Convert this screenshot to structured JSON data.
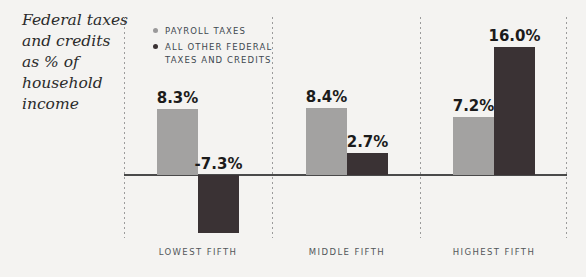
{
  "title": {
    "lines": [
      "Federal taxes",
      "and credits",
      "as % of",
      "household",
      "income"
    ]
  },
  "legend": {
    "items": [
      {
        "label": "PAYROLL TAXES",
        "color": "#9a999a"
      },
      {
        "label": "ALL OTHER FEDERAL TAXES AND CREDITS",
        "color": "#3a3234"
      }
    ]
  },
  "chart_data": {
    "type": "bar",
    "title": "Federal taxes and credits as % of household income",
    "categories": [
      "LOWEST FIFTH",
      "MIDDLE FIFTH",
      "HIGHEST FIFTH"
    ],
    "series": [
      {
        "name": "PAYROLL TAXES",
        "color": "#a3a2a1",
        "values": [
          8.3,
          8.4,
          7.2
        ],
        "value_labels": [
          "8.3%",
          "8.4%",
          "7.2%"
        ]
      },
      {
        "name": "ALL OTHER FEDERAL TAXES AND CREDITS",
        "color": "#3a3234",
        "values": [
          -7.3,
          2.7,
          16.0
        ],
        "value_labels": [
          "-7.3%",
          "2.7%",
          "16.0%"
        ]
      }
    ],
    "baseline": 0,
    "ylim": [
      -8,
      17
    ],
    "grid": false,
    "legend_position": "top-left"
  },
  "colors": {
    "background": "#f4f3f1",
    "axis_line": "#4a4a4a",
    "divider": "#9b9b9b",
    "value_label": "#1b1b1b",
    "category_label": "#53575a",
    "legend_text": "#3e4850",
    "title_text": "#2b2b2b"
  }
}
